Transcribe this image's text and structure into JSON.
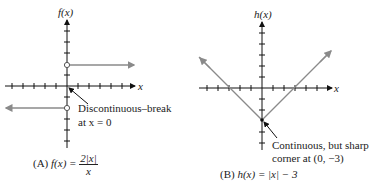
{
  "graph_a": {
    "y_axis_label": "f(x)",
    "x_axis_label": "x",
    "annotation_line1": "Discontinuous–break",
    "annotation_line2": "at x = 0",
    "caption_prefix": "(A)",
    "caption_lhs": "f(x) =",
    "caption_num": "2|x|",
    "caption_den": "x",
    "line_color": "#8a8a8a"
  },
  "graph_b": {
    "y_axis_label": "h(x)",
    "x_axis_label": "x",
    "annotation_line1": "Continuous, but sharp",
    "annotation_line2": "corner at (0, −3)",
    "caption_prefix": "(B)",
    "caption_text": "h(x) = |x| − 3",
    "line_color": "#8a8a8a"
  }
}
